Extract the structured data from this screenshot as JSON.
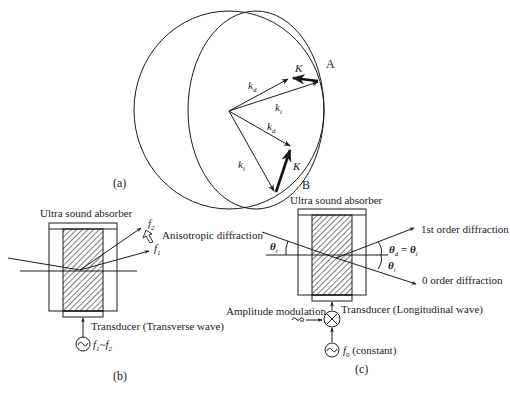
{
  "figure": {
    "panel_a": {
      "caption": "(a)",
      "point_a_label": "A",
      "point_b_label": "B",
      "vectors": {
        "kd_top": "k",
        "kd_top_sub": "d",
        "ki_top": "k",
        "ki_top_sub": "i",
        "kd_bottom": "k",
        "kd_bottom_sub": "d",
        "ki_bottom": "k",
        "ki_bottom_sub": "i",
        "K_top": "K",
        "K_bottom": "K"
      }
    },
    "panel_b": {
      "caption": "(b)",
      "absorber_label": "Ultra sound absorber",
      "diffraction_label": "Anisotropic diffraction",
      "f2_label": "f",
      "f2_sub": "2",
      "f1_label": "f",
      "f1_sub": "1",
      "transducer_label": "Transducer (Transverse wave)",
      "source_label_f1": "f",
      "source_sub_1": "1",
      "source_tilde": "~",
      "source_label_f2": "f",
      "source_sub_2": "2"
    },
    "panel_c": {
      "caption": "(c)",
      "absorber_label": "Ultra sound absorber",
      "first_order_label": "1st order diffraction",
      "zero_order_label": "0 order diffraction",
      "theta_i_label": "θ",
      "theta_i_sub": "i",
      "theta_d_eq": "θ",
      "theta_d_sub": "d",
      "theta_eq_sign": " = θ",
      "theta_eq_sub": "i",
      "theta_i2_label": "θ",
      "theta_i2_sub": "i",
      "transducer_label": "Transducer (Longitudinal wave)",
      "modulation_label": "Amplitude modulation",
      "source_label": "f",
      "source_sub": "0",
      "source_note": " (constant)"
    }
  }
}
